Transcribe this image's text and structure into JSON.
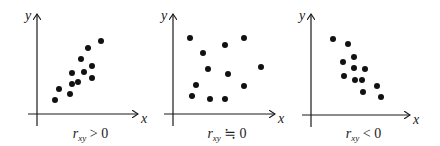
{
  "chart_data": [
    {
      "type": "scatter",
      "title": "",
      "caption": "r_xy > 0",
      "caption_parts": {
        "r": "r",
        "sub": "xy",
        "rel": " > 0"
      },
      "xlabel": "x",
      "ylabel": "y",
      "ticks": "none",
      "points_px": [
        [
          55,
          100
        ],
        [
          59,
          89
        ],
        [
          70,
          94
        ],
        [
          72,
          84
        ],
        [
          72,
          73
        ],
        [
          78,
          82
        ],
        [
          81,
          59
        ],
        [
          84,
          72
        ],
        [
          88,
          48
        ],
        [
          92,
          66
        ],
        [
          92,
          78
        ],
        [
          101,
          41
        ]
      ],
      "axis": {
        "origin": [
          37,
          114
        ],
        "x_end": 138,
        "y_top": 14,
        "x_start": 28,
        "y_bottom": 126
      }
    },
    {
      "type": "scatter",
      "title": "",
      "caption": "r_xy ≒ 0",
      "caption_parts": {
        "r": "r",
        "sub": "xy",
        "rel": " ≒ 0"
      },
      "xlabel": "x",
      "ylabel": "y",
      "ticks": "none",
      "points_px": [
        [
          190,
          38
        ],
        [
          203,
          53
        ],
        [
          225,
          45
        ],
        [
          244,
          38
        ],
        [
          208,
          69
        ],
        [
          261,
          67
        ],
        [
          228,
          74
        ],
        [
          196,
          85
        ],
        [
          244,
          86
        ],
        [
          192,
          96
        ],
        [
          210,
          99
        ],
        [
          225,
          99
        ]
      ],
      "axis": {
        "origin": [
          173,
          114
        ],
        "x_end": 275,
        "y_top": 14,
        "x_start": 164,
        "y_bottom": 126
      }
    },
    {
      "type": "scatter",
      "title": "",
      "caption": "r_xy < 0",
      "caption_parts": {
        "r": "r",
        "sub": "xy",
        "rel": " < 0"
      },
      "xlabel": "x",
      "ylabel": "y",
      "ticks": "none",
      "points_px": [
        [
          333,
          39
        ],
        [
          348,
          44
        ],
        [
          354,
          57
        ],
        [
          343,
          62
        ],
        [
          354,
          68
        ],
        [
          365,
          69
        ],
        [
          344,
          76
        ],
        [
          355,
          80
        ],
        [
          362,
          80
        ],
        [
          377,
          86
        ],
        [
          363,
          92
        ],
        [
          381,
          97
        ]
      ],
      "axis": {
        "origin": [
          311,
          115
        ],
        "x_end": 410,
        "y_top": 14,
        "x_start": 302,
        "y_bottom": 127
      }
    }
  ],
  "colors": {
    "axis": "#1a1a1a",
    "dot": "#111111",
    "background": "#ffffff"
  }
}
